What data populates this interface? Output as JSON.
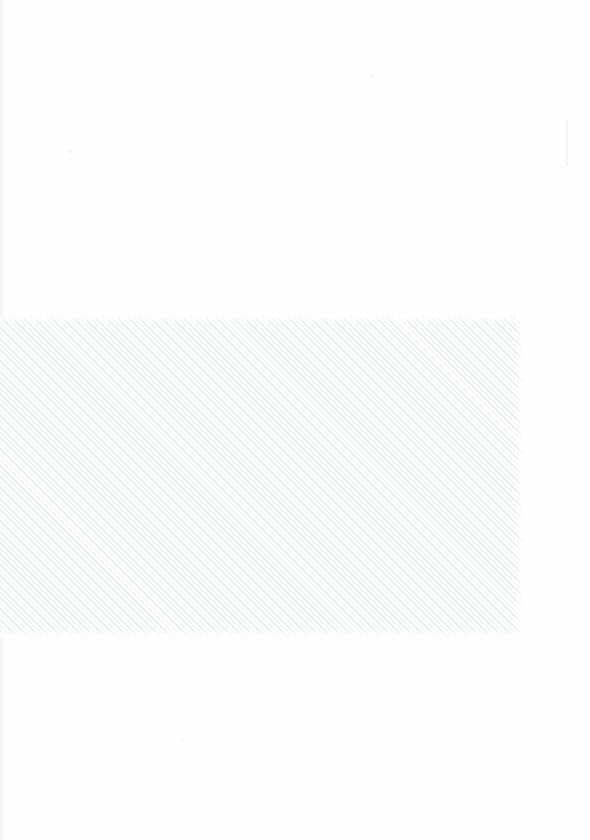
{
  "page": {
    "width": 590,
    "height": 840,
    "background_color": "#fefefe",
    "visible_text": ""
  },
  "hatch_region": {
    "name": "hatched-rectangle",
    "x": 0,
    "y": 316,
    "width": 523,
    "height": 321,
    "fill_color": "#ffffff",
    "stripe_color": "#e6eaee",
    "stripe_angle_degrees": 45,
    "stripe_period_px": 3.9,
    "stripe_width_px": 1.05,
    "label": ""
  },
  "artifacts": {
    "scan_edge_left": {
      "name": "scan-edge-shadow",
      "x": 0,
      "y": 0,
      "width": 5,
      "height": 840,
      "color": "#f0f2f4"
    },
    "faint_mark": {
      "name": "faint-vertical-mark",
      "x": 566,
      "y": 120,
      "width": 2,
      "height": 46,
      "color": "#f3f5f6"
    }
  }
}
